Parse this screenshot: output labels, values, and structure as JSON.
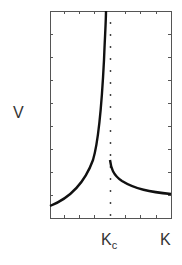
{
  "chart_data": {
    "type": "line",
    "title": "",
    "xlabel": "K",
    "ylabel": "V",
    "x_tick_labels": [
      "K_c"
    ],
    "critical_point": {
      "label": "K",
      "subscript": "c",
      "x": 0.5
    },
    "xlim": [
      0,
      1
    ],
    "ylim": [
      0,
      1
    ],
    "grid": false,
    "legend": null,
    "annotations": [
      "vertical dotted line at K_c"
    ],
    "series": [
      {
        "name": "left branch (diverging as K → K_c)",
        "x": [
          0.0,
          0.1,
          0.2,
          0.3,
          0.35,
          0.4,
          0.43,
          0.45,
          0.47,
          0.48
        ],
        "y": [
          0.06,
          0.12,
          0.19,
          0.28,
          0.35,
          0.45,
          0.55,
          0.66,
          0.82,
          1.0
        ]
      },
      {
        "name": "right branch (finite jump at K_c)",
        "x": [
          0.5,
          0.52,
          0.55,
          0.6,
          0.7,
          0.8,
          0.9,
          1.0
        ],
        "y": [
          0.28,
          0.22,
          0.17,
          0.14,
          0.11,
          0.1,
          0.09,
          0.08
        ]
      }
    ]
  },
  "labels": {
    "y_axis": "V",
    "x_axis": "K",
    "kc_main": "K",
    "kc_sub": "c"
  }
}
